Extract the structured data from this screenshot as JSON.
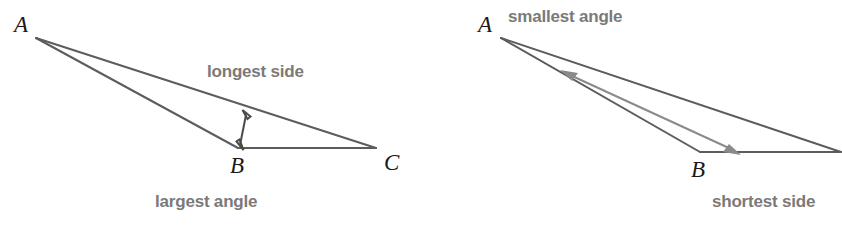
{
  "figure": {
    "background_color": "#ffffff",
    "edge_color": "#5c5c5c",
    "label_color": "#7a7a7a",
    "vertex_color": "#1a1a1a",
    "measure_arrow_color": "#4a4a4a",
    "angle_arrow_color": "#8a8a8a"
  },
  "left_diagram": {
    "vertices": [
      {
        "name": "A",
        "label": "A",
        "x": 36,
        "y": 38,
        "label_x": 14,
        "label_y": 32
      },
      {
        "name": "B",
        "label": "B",
        "x": 238,
        "y": 148,
        "label_x": 230,
        "label_y": 173
      },
      {
        "name": "C",
        "label": "C",
        "x": 376,
        "y": 148,
        "label_x": 384,
        "label_y": 170
      }
    ],
    "callouts": [
      {
        "name": "longest-side",
        "text": "longest side",
        "x": 207,
        "y": 77
      },
      {
        "name": "largest-angle",
        "text": "largest angle",
        "x": 155,
        "y": 207
      }
    ],
    "measure_arrow": {
      "name": "height-measure-arrow",
      "from_x": 247,
      "from_y": 112,
      "to_x": 240,
      "to_y": 148,
      "double_headed": true
    }
  },
  "right_diagram": {
    "vertices": [
      {
        "name": "A",
        "label": "A",
        "x": 501,
        "y": 38,
        "label_x": 478,
        "label_y": 32
      },
      {
        "name": "B",
        "label": "B",
        "x": 700,
        "y": 152,
        "label_x": 691,
        "label_y": 177
      },
      {
        "name": "C",
        "label": "",
        "x": 840,
        "y": 152,
        "label_x": 0,
        "label_y": 0
      }
    ],
    "callouts": [
      {
        "name": "smallest-angle",
        "text": "smallest angle",
        "x": 508,
        "y": 22
      },
      {
        "name": "shortest-side",
        "text": "shortest side",
        "x": 712,
        "y": 207
      }
    ],
    "measure_arrow": {
      "name": "side-measure-arrow",
      "from_x": 563,
      "from_y": 72,
      "to_x": 738,
      "to_y": 152,
      "double_headed": true
    }
  }
}
